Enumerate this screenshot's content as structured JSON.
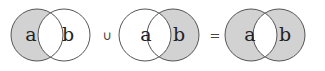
{
  "diagram": {
    "colors": {
      "shade": "#d2d2d2",
      "stroke": "#555555",
      "background": "#ffffff"
    },
    "panels": [
      {
        "left_label": "a",
        "right_label": "b",
        "shaded": "left-only"
      },
      {
        "left_label": "a",
        "right_label": "b",
        "shaded": "right-only"
      },
      {
        "left_label": "a",
        "right_label": "b",
        "shaded": "symmetric-difference"
      }
    ],
    "operators": [
      "∪",
      "="
    ]
  }
}
